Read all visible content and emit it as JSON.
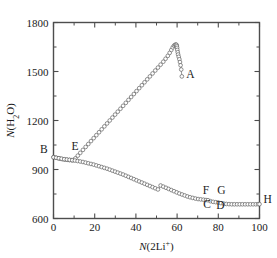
{
  "chart_data": {
    "type": "scatter",
    "title": "",
    "subtitle": "",
    "xlabel": "N(2Li+)",
    "xlabel_parts": {
      "italic": "N",
      "rest": "(2Li",
      "sup": "+",
      "tail": ")"
    },
    "ylabel": "N(H2O)",
    "ylabel_parts": {
      "italic": "N",
      "rest": "(H",
      "sub": "2",
      "tail": "O)"
    },
    "xlim": [
      0,
      100
    ],
    "ylim": [
      600,
      1800
    ],
    "xticks": [
      0,
      20,
      40,
      60,
      80,
      100
    ],
    "xticklabels": [
      "0",
      "20",
      "40",
      "60",
      "80",
      "100"
    ],
    "xminorticks": [
      10,
      30,
      50,
      70,
      90
    ],
    "yticks": [
      600,
      900,
      1200,
      1500,
      1800
    ],
    "yticklabels": [
      "600",
      "900",
      "1200",
      "1500",
      "1800"
    ],
    "yminorticks": [
      750,
      1050,
      1350,
      1650
    ],
    "grid": false,
    "legend": null,
    "marker": "open-circle",
    "marker_color": "#ffffff",
    "marker_edge_color": "#555555",
    "line_color": "#6b6b6b",
    "frame_color": "#4d4d4d",
    "series": [
      {
        "name": "upper-branch-B-E-peak-A",
        "x": [
          0.0,
          1.1,
          2.2,
          3.3,
          4.4,
          5.5,
          6.6,
          7.7,
          8.8,
          9.6,
          10.6,
          11.8,
          13.0,
          14.3,
          15.6,
          16.9,
          18.2,
          19.5,
          20.8,
          22.1,
          23.4,
          24.7,
          26.0,
          27.3,
          28.6,
          29.9,
          31.2,
          32.5,
          33.8,
          35.1,
          36.4,
          37.7,
          39.0,
          40.3,
          41.6,
          42.9,
          44.2,
          45.5,
          46.8,
          48.1,
          49.4,
          50.7,
          52.0,
          53.3,
          54.4,
          55.5,
          56.4,
          57.2,
          57.9,
          58.5,
          59.0,
          59.4,
          59.7,
          59.9,
          60.0,
          60.1,
          60.3,
          60.5,
          60.8,
          61.1,
          61.4,
          61.7,
          62.0,
          62.3
        ],
        "y": [
          975,
          972,
          969,
          966,
          963,
          961,
          959,
          958,
          957,
          957,
          968,
          985,
          1002,
          1020,
          1038,
          1056,
          1074,
          1092,
          1110,
          1128,
          1146,
          1164,
          1182,
          1200,
          1218,
          1236,
          1254,
          1272,
          1290,
          1308,
          1326,
          1344,
          1362,
          1380,
          1398,
          1416,
          1434,
          1452,
          1470,
          1488,
          1506,
          1524,
          1542,
          1560,
          1578,
          1596,
          1614,
          1632,
          1648,
          1658,
          1663,
          1665,
          1663,
          1656,
          1645,
          1632,
          1618,
          1604,
          1590,
          1575,
          1558,
          1538,
          1512,
          1470
        ]
      },
      {
        "name": "lower-branch-B-E-C-D-H",
        "x": [
          0.0,
          1.3,
          2.6,
          3.9,
          5.2,
          6.5,
          7.8,
          9.1,
          10.4,
          11.7,
          13.0,
          14.3,
          15.6,
          16.9,
          18.2,
          19.5,
          20.8,
          22.1,
          23.4,
          24.7,
          26.0,
          27.3,
          28.6,
          29.9,
          31.2,
          32.5,
          33.8,
          35.1,
          36.4,
          37.7,
          39.0,
          40.3,
          41.6,
          42.9,
          44.2,
          45.5,
          46.8,
          48.1,
          49.4,
          50.7,
          52.0,
          53.3,
          54.6,
          55.9,
          57.2,
          58.5,
          59.8,
          61.1,
          62.4,
          63.7,
          65.0,
          66.3,
          67.6,
          68.9,
          70.2,
          71.5,
          72.8,
          74.0,
          75.0,
          76.2,
          77.5,
          78.8,
          80.0,
          81.3,
          82.6,
          83.9,
          85.2,
          86.5,
          87.8,
          89.1,
          90.4,
          91.7,
          93.0,
          94.3,
          95.6,
          96.9,
          98.2,
          99.3,
          100.0
        ],
        "y": [
          975,
          972,
          969,
          966,
          963,
          961,
          959,
          957,
          955,
          952,
          949,
          946,
          942,
          938,
          934,
          930,
          925,
          920,
          915,
          910,
          905,
          899,
          893,
          887,
          881,
          875,
          869,
          862,
          855,
          848,
          841,
          834,
          827,
          820,
          813,
          806,
          799,
          792,
          785,
          778,
          802,
          795,
          788,
          781,
          774,
          767,
          760,
          753,
          747,
          741,
          735,
          730,
          726,
          722,
          719,
          717,
          715,
          713,
          712,
          706,
          702,
          700,
          698,
          694,
          691,
          689,
          688,
          687,
          687,
          687,
          687,
          687,
          687,
          687,
          687,
          687,
          687,
          688,
          688
        ]
      }
    ],
    "annotations": [
      {
        "label": "A",
        "x": 64.5,
        "y": 1462,
        "anchor": "left"
      },
      {
        "label": "B",
        "x": -2.8,
        "y": 1000,
        "anchor": "right"
      },
      {
        "label": "C",
        "x": 74.5,
        "y": 665,
        "anchor": "middle"
      },
      {
        "label": "D",
        "x": 81.0,
        "y": 657,
        "anchor": "middle"
      },
      {
        "label": "E",
        "x": 10.5,
        "y": 1020,
        "anchor": "middle"
      },
      {
        "label": "F",
        "x": 74.0,
        "y": 752,
        "anchor": "middle"
      },
      {
        "label": "G",
        "x": 81.5,
        "y": 752,
        "anchor": "middle"
      },
      {
        "label": "H",
        "x": 102.0,
        "y": 695,
        "anchor": "left"
      }
    ]
  }
}
